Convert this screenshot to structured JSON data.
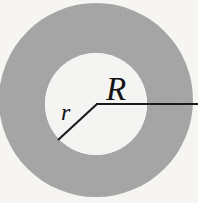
{
  "figure": {
    "background_color": "#f6f5f2",
    "annulus_color": "#a8a8a8",
    "inner_disk_color": "#f4f4f2",
    "line_color": "#1a1a1a",
    "labels": {
      "outer_radius": "R",
      "inner_radius": "r"
    },
    "geometry": {
      "center_x": 96,
      "center_y": 104,
      "outer_circle_center_y": 100,
      "outer_radius_px": 97,
      "inner_radius_px": 51,
      "outer_radius_line": {
        "from_x": 96,
        "from_y": 104,
        "to_x": 198,
        "to_y": 104
      },
      "inner_radius_line": {
        "from_x": 96,
        "from_y": 104,
        "to_x": 58,
        "to_y": 140
      },
      "label_R_position": {
        "x": 106,
        "y": 100
      },
      "label_r_position": {
        "x": 61,
        "y": 120
      }
    }
  }
}
